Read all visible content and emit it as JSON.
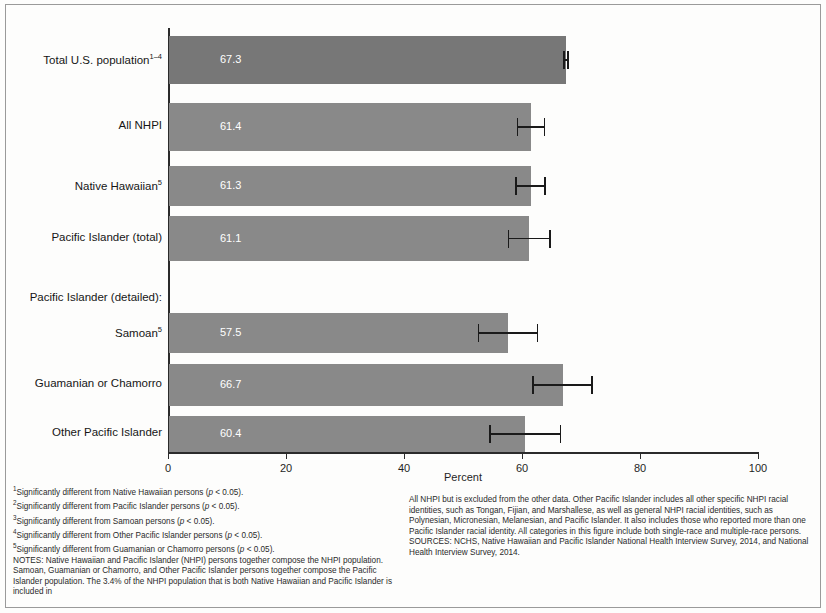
{
  "figure": {
    "xaxis_title": "Percent"
  },
  "chart_data": {
    "type": "bar",
    "orientation": "horizontal",
    "title": "",
    "xlabel": "Percent",
    "ylabel": "",
    "xlim": [
      0,
      100
    ],
    "xticks": [
      "0",
      "20",
      "40",
      "60",
      "80",
      "100"
    ],
    "grid": false,
    "legend": "none",
    "categories": [
      "Total U.S. population",
      "All NHPI",
      "Native Hawaiian",
      "Pacific Islander (total)",
      "Samoan",
      "Guamanian or Chamorro",
      "Other Pacific Islander"
    ],
    "values": [
      67.3,
      61.4,
      61.3,
      61.1,
      57.5,
      66.7,
      60.4
    ],
    "value_labels": [
      "67.3",
      "61.4",
      "61.3",
      "61.1",
      "57.5",
      "66.7",
      "60.4"
    ],
    "error_bars": [
      {
        "low": 67.0,
        "high": 67.7
      },
      {
        "low": 59.1,
        "high": 63.7
      },
      {
        "low": 58.8,
        "high": 63.8
      },
      {
        "low": 57.6,
        "high": 64.6
      },
      {
        "low": 52.5,
        "high": 62.5
      },
      {
        "low": 61.7,
        "high": 71.7
      },
      {
        "low": 54.4,
        "high": 66.4
      }
    ],
    "group_label": "Pacific Islander (detailed):",
    "category_superscripts": [
      "1–4",
      "",
      "5",
      "",
      "5",
      "",
      ""
    ]
  },
  "categories": [
    {
      "label": "Total U.S. population",
      "sup": "1–4",
      "value": "67.3"
    },
    {
      "label": "All NHPI",
      "sup": "",
      "value": "61.4"
    },
    {
      "label": "Native Hawaiian",
      "sup": "5",
      "value": "61.3"
    },
    {
      "label": "Pacific Islander (total)",
      "sup": "",
      "value": "61.1"
    },
    {
      "label": "Samoan",
      "sup": "5",
      "value": "57.5"
    },
    {
      "label": "Guamanian or Chamorro",
      "sup": "",
      "value": "66.7"
    },
    {
      "label": "Other Pacific Islander",
      "sup": "",
      "value": "60.4"
    }
  ],
  "group_header": "Pacific Islander (detailed):",
  "footnotes": {
    "left": [
      {
        "sup": "1",
        "text": "Significantly different from Native Hawaiian persons (",
        "italic": "p",
        "tail": " < 0.05)."
      },
      {
        "sup": "2",
        "text": "Significantly different from Pacific Islander persons (",
        "italic": "p",
        "tail": " < 0.05)."
      },
      {
        "sup": "3",
        "text": "Significantly different from Samoan persons (",
        "italic": "p",
        "tail": " < 0.05)."
      },
      {
        "sup": "4",
        "text": "Significantly different from Other Pacific Islander persons (",
        "italic": "p",
        "tail": " < 0.05)."
      },
      {
        "sup": "5",
        "text": "Significantly different from Guamanian or Chamorro persons (",
        "italic": "p",
        "tail": " < 0.05)."
      }
    ],
    "notes_paragraph": "NOTES: Native Hawaiian and Pacific Islander (NHPI) persons together compose the NHPI population. Samoan, Guamanian or Chamorro, and Other Pacific Islander persons together compose the Pacific Islander population. The 3.4% of the NHPI population that is both Native Hawaiian and Pacific Islander is included in",
    "notes_continued": "All NHPI but is excluded from the other data. Other Pacific Islander includes all other specific NHPI racial identities, such as Tongan, Fijian, and Marshallese, as well as general NHPI racial identities, such as Polynesian, Micronesian, Melanesian, and Pacific Islander. It also includes those who reported more than one Pacific Islander racial identity. All categories in this figure include both single-race and multiple-race persons.",
    "sources": "SOURCES: NCHS, Native Hawaiian and Pacific Islander National Health Interview Survey, 2014, and National Health Interview Survey, 2014."
  },
  "colors": {
    "bar": "#898989",
    "bar_dark": "#777777",
    "axis": "#2b2b2b",
    "value_text": "#ffffff",
    "frame": "#9a9a9a"
  }
}
